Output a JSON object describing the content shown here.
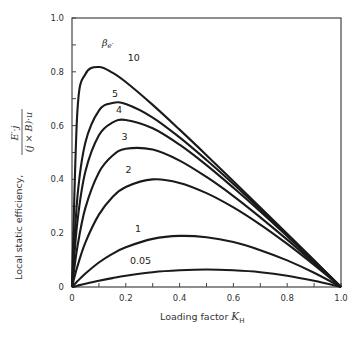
{
  "chart_data": {
    "type": "line",
    "title": "",
    "xlabel": "Loading factor K_H",
    "xlabel_parts": {
      "text": "Loading factor ",
      "symbol": "K",
      "subscript": "H"
    },
    "ylabel": "Local static efficiency, E'·j / ((j × B)·u)",
    "ylabel_parts": {
      "text": "Local static efficiency,",
      "numerator": "E′·j",
      "denominator": "(j × B)·u"
    },
    "legend_title": "βe′",
    "xlim": [
      0,
      1.0
    ],
    "ylim": [
      0,
      1.0
    ],
    "x_ticks": [
      0,
      0.2,
      0.4,
      0.6,
      0.8,
      1.0
    ],
    "x_tick_labels": [
      "0",
      "0.2",
      "0.4",
      "0.6",
      "0.8",
      "1.0"
    ],
    "y_ticks": [
      0,
      0.2,
      0.4,
      0.6,
      0.8,
      1.0
    ],
    "y_tick_labels": [
      "0",
      "0.2",
      "0.4",
      "0.6",
      "0.8",
      "1.0"
    ],
    "minor_tick_step": 0.1,
    "grid": false,
    "x": [
      0,
      0.02,
      0.05,
      0.1,
      0.15,
      0.2,
      0.3,
      0.4,
      0.5,
      0.6,
      0.7,
      0.8,
      0.9,
      1.0
    ],
    "series": [
      {
        "name": "10",
        "label_pos": [
          0.23,
          0.84
        ],
        "values": [
          0,
          0.653,
          0.792,
          0.818,
          0.797,
          0.762,
          0.677,
          0.585,
          0.49,
          0.393,
          0.296,
          0.198,
          0.099,
          0
        ]
      },
      {
        "name": "5",
        "label_pos": [
          0.16,
          0.705
        ],
        "values": [
          0,
          0.333,
          0.538,
          0.656,
          0.684,
          0.68,
          0.63,
          0.556,
          0.472,
          0.383,
          0.289,
          0.194,
          0.098,
          0
        ]
      },
      {
        "name": "4",
        "label_pos": [
          0.175,
          0.645
        ],
        "values": [
          0,
          0.242,
          0.43,
          0.564,
          0.611,
          0.621,
          0.59,
          0.529,
          0.453,
          0.369,
          0.281,
          0.189,
          0.095,
          0
        ]
      },
      {
        "name": "3",
        "label_pos": [
          0.195,
          0.545
        ],
        "values": [
          0,
          0.149,
          0.295,
          0.426,
          0.488,
          0.514,
          0.511,
          0.47,
          0.409,
          0.338,
          0.259,
          0.176,
          0.089,
          0
        ]
      },
      {
        "name": "2",
        "label_pos": [
          0.21,
          0.425
        ],
        "values": [
          0,
          0.076,
          0.166,
          0.269,
          0.334,
          0.372,
          0.4,
          0.387,
          0.349,
          0.296,
          0.232,
          0.16,
          0.082,
          0
        ]
      },
      {
        "name": "1",
        "label_pos": [
          0.245,
          0.205
        ],
        "values": [
          0,
          0.021,
          0.05,
          0.091,
          0.123,
          0.148,
          0.179,
          0.19,
          0.185,
          0.167,
          0.137,
          0.099,
          0.053,
          0
        ]
      },
      {
        "name": "0.05",
        "label_pos": [
          0.255,
          0.085
        ],
        "values": [
          0,
          0.005,
          0.012,
          0.023,
          0.033,
          0.042,
          0.055,
          0.062,
          0.065,
          0.062,
          0.055,
          0.042,
          0.023,
          0
        ]
      }
    ],
    "line_color": "#1a1a1a",
    "axis_color": "#444444"
  }
}
